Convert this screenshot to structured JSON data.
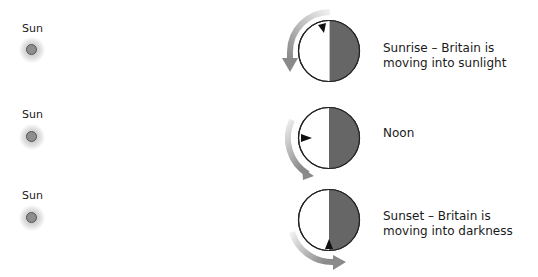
{
  "rows": [
    {
      "sun_label": "Sun",
      "caption": "Sunrise – Britain is moving into sunlight",
      "marker_position": "top-left"
    },
    {
      "sun_label": "Sun",
      "caption": "Noon",
      "marker_position": "left"
    },
    {
      "sun_label": "Sun",
      "caption": "Sunset – Britain is moving into darkness",
      "marker_position": "bottom"
    }
  ],
  "colors": {
    "night_side": "#666666",
    "day_side": "#ffffff",
    "outline": "#222222",
    "marker": "#111111",
    "arrow_light": "#e6e6e6",
    "arrow_dark": "#8a8a8a",
    "sun": "#8e8e8e"
  },
  "icons": {
    "sun": "sun-icon",
    "earth": "earth-icon",
    "rotation_arrow": "rotation-arrow-icon",
    "britain_marker": "britain-marker-icon"
  }
}
